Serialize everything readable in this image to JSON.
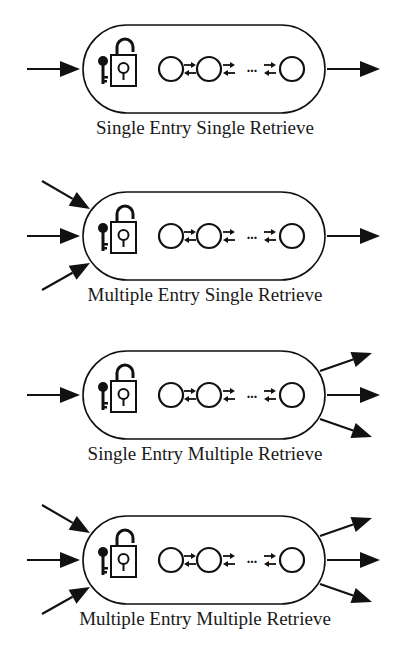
{
  "figure": {
    "panels": [
      {
        "id": "sesr",
        "caption": "Single Entry Single Retrieve",
        "entry": "single",
        "retrieve": "single"
      },
      {
        "id": "mesr",
        "caption": "Multiple Entry Single Retrieve",
        "entry": "multiple",
        "retrieve": "single"
      },
      {
        "id": "semr",
        "caption": "Single Entry Multiple Retrieve",
        "entry": "single",
        "retrieve": "multiple"
      },
      {
        "id": "memr",
        "caption": "Multiple Entry Multiple Retrieve",
        "entry": "multiple",
        "retrieve": "multiple"
      }
    ],
    "icons": {
      "key": "key-icon",
      "lock": "unlocked-padlock-icon",
      "node": "circle-node-icon",
      "link": "bidirectional-arrows-icon",
      "ellipsis": "..."
    },
    "colors": {
      "stroke": "#111111",
      "background": "#ffffff"
    }
  }
}
